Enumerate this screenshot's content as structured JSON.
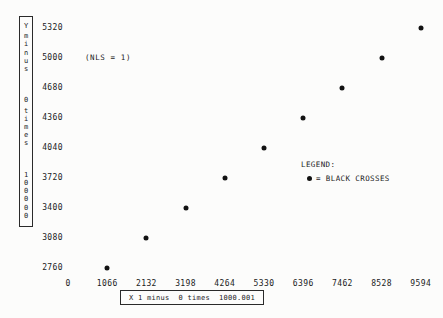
{
  "colors": {
    "background": "#fcfcfb",
    "ink": "#1b1b1b",
    "marker": "#121212"
  },
  "annotations": {
    "nls": "(NLS = 1)"
  },
  "legend": {
    "title": "LEGEND:",
    "marker_icon": "black-dot",
    "entry": "= BLACK CROSSES"
  },
  "y_scale_box": {
    "lines": [
      "Y minus",
      "0 times",
      "100000"
    ]
  },
  "x_scale_box": {
    "parts": [
      "X 1 minus",
      "0 times",
      "1000.001"
    ]
  },
  "chart_data": {
    "type": "scatter",
    "title": "",
    "xlabel": "X 1 minus 0 times 1000.001",
    "ylabel": "Y minus 0 times 100000",
    "grid": false,
    "legend_position": "right-middle",
    "marker": "filled-circle",
    "xlim": [
      0,
      9594
    ],
    "ylim": [
      2760,
      5320
    ],
    "x_ticks": [
      0,
      1066,
      2132,
      3198,
      4264,
      5330,
      6396,
      7462,
      8528,
      9594
    ],
    "y_ticks": [
      2760,
      3080,
      3400,
      3720,
      4040,
      4360,
      4680,
      5000,
      5320
    ],
    "points": [
      {
        "x": 1066,
        "y": 2760
      },
      {
        "x": 2132,
        "y": 3080
      },
      {
        "x": 3198,
        "y": 3400
      },
      {
        "x": 4264,
        "y": 3720
      },
      {
        "x": 5330,
        "y": 4040
      },
      {
        "x": 6396,
        "y": 4360
      },
      {
        "x": 7462,
        "y": 4680
      },
      {
        "x": 8528,
        "y": 5000
      },
      {
        "x": 9594,
        "y": 5320
      }
    ]
  }
}
